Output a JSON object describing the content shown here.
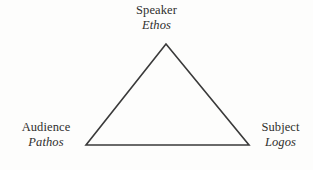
{
  "figure": {
    "background_color": "#fdfdfc",
    "stroke_color": "#3a3a3a",
    "text_color": "#2f2f2d"
  },
  "diagram": {
    "type": "triangle",
    "shape_name": "rhetorical-triangle",
    "vertices": [
      {
        "id": "apex",
        "x": 166,
        "y": 44
      },
      {
        "id": "bottom-left",
        "x": 86,
        "y": 145
      },
      {
        "id": "bottom-right",
        "x": 249,
        "y": 145
      }
    ],
    "stroke_width": 1.6
  },
  "labels": {
    "top": {
      "name": "speaker",
      "role": "Speaker",
      "appeal": "Ethos"
    },
    "left": {
      "name": "audience",
      "role": "Audience",
      "appeal": "Pathos"
    },
    "right": {
      "name": "subject",
      "role": "Subject",
      "appeal": "Logos"
    }
  }
}
